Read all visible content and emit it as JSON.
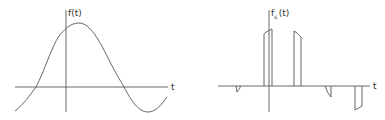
{
  "figure": {
    "colors": {
      "line": "#555555",
      "axis": "#5a5a5a",
      "background": "#ffffff"
    }
  },
  "left_plot": {
    "y_label": "f(t)",
    "x_label": "t",
    "signal": "sinusoid",
    "axis": {
      "origin_x": 66,
      "origin_y": 87,
      "x_start": 15,
      "x_end": 168,
      "y_start": 10,
      "y_end": 112
    },
    "curve_path": "M15,111 C24,104 30,95 36,87 C44,72 52,46 59,36 C64,30 70,23 79,23 C90,23 99,40 108,58 C115,72 120,80 124,87 C131,100 138,112 148,112 C156,112 162,104 167,97"
  },
  "right_plot": {
    "y_label": "f",
    "y_label_subscript": "s",
    "y_label_suffix": "(t)",
    "x_label": "t",
    "signal": "sampled pulses",
    "axis": {
      "origin_x": 269,
      "origin_y": 86,
      "x_start": 218,
      "x_end": 370,
      "y_start": 10,
      "y_end": 112
    },
    "pulses": [
      {
        "name": "pulse-1",
        "path": "M236,86 L237,92 L240,88 L240,86"
      },
      {
        "name": "pulse-2",
        "path": "M264,86 L264,34 L266,32 L272,29 L272,86"
      },
      {
        "name": "pulse-3",
        "path": "M294,86 L294,31 L297,33 L301,37 L301,86"
      },
      {
        "name": "pulse-4",
        "path": "M325,86 L328,93 L331,97 L331,86"
      },
      {
        "name": "pulse-5",
        "path": "M355,86 L355,110 L357,109 L362,106 L362,86"
      }
    ]
  }
}
